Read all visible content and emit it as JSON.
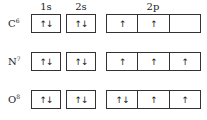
{
  "headers": {
    "s1": "1s",
    "s2": "2s",
    "p2": "2p"
  },
  "rows": [
    {
      "element": "C",
      "z": "6",
      "s1": "↑↓",
      "s2": "↑↓",
      "p": [
        "↑",
        "↑",
        ""
      ]
    },
    {
      "element": "N",
      "z": "7",
      "s1": "↑↓",
      "s2": "↑↓",
      "p": [
        "↑",
        "↑",
        "↑"
      ]
    },
    {
      "element": "O",
      "z": "8",
      "s1": "↑↓",
      "s2": "↑↓",
      "p": [
        "↑↓",
        "↑",
        "↑"
      ]
    }
  ]
}
